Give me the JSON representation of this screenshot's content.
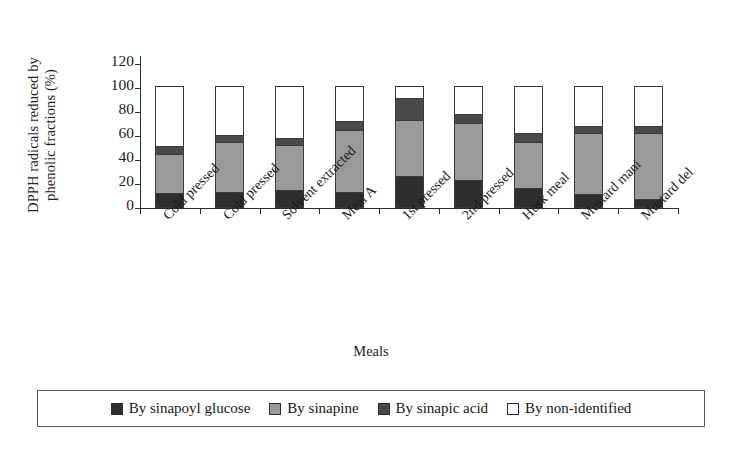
{
  "chart_data": {
    "type": "bar",
    "stacked": true,
    "title": "",
    "xlabel": "Meals",
    "ylabel": "DPPH radicals reduced by phenolic fractions (%)",
    "ylim": [
      0,
      120
    ],
    "yticks": [
      0,
      20,
      40,
      60,
      80,
      100,
      120
    ],
    "grid": false,
    "legend_position": "bottom",
    "categories": [
      "Cold pressed",
      "Cold pressed",
      "Solvent extracted",
      "Meal A",
      "1st pressed",
      "2nd pressed",
      "Husk meal",
      "Mustard mani",
      "Mustard del"
    ],
    "series": [
      {
        "name": "By sinapoyl glucose",
        "color": "#2e2e2e",
        "values": [
          11,
          12,
          13,
          12,
          25,
          22,
          15,
          10,
          6
        ]
      },
      {
        "name": "By sinapine",
        "color": "#9a9a9a",
        "values": [
          32,
          41,
          38,
          51,
          47,
          47,
          38,
          51,
          55
        ]
      },
      {
        "name": "By sinapic acid",
        "color": "#4a4a4a",
        "values": [
          7,
          6,
          6,
          8,
          18,
          8,
          8,
          6,
          6
        ]
      },
      {
        "name": "By non-identified",
        "color": "#ffffff",
        "values": [
          50,
          41,
          43,
          29,
          10,
          23,
          39,
          33,
          33
        ]
      }
    ]
  },
  "axis": {
    "y_title": "DPPH radicals reduced by phenolic fractions (%)",
    "x_title": "Meals",
    "y_tick_labels": [
      "120",
      "100",
      "80",
      "60",
      "40",
      "20",
      "0"
    ]
  },
  "legend": {
    "items": [
      {
        "label": "By sinapoyl glucose",
        "color": "#2e2e2e"
      },
      {
        "label": "By sinapine",
        "color": "#9a9a9a"
      },
      {
        "label": "By sinapic acid",
        "color": "#4a4a4a"
      },
      {
        "label": "By non-identified",
        "color": "#ffffff"
      }
    ]
  }
}
